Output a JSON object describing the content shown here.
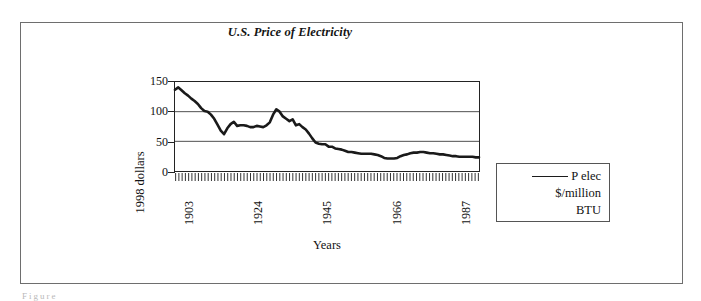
{
  "figure": {
    "caption_remnant": "Figure"
  },
  "legend": {
    "position": "right",
    "swatch": "line-swatch",
    "lines": [
      "P elec",
      "$/million",
      "BTU"
    ]
  },
  "chart_data": {
    "type": "line",
    "title": "U.S. Price of Electricity",
    "xlabel": "Years",
    "ylabel": "1998 dollars",
    "grid": true,
    "grid_axis": "y",
    "legend_position": "right",
    "xlim": [
      1902,
      1995
    ],
    "ylim": [
      0,
      150
    ],
    "y_ticks": [
      0,
      50,
      100,
      150
    ],
    "y_tick_labels": [
      "0",
      "50",
      "100",
      "150"
    ],
    "x_ticks": [
      1903,
      1924,
      1945,
      1966,
      1987
    ],
    "x_tick_labels": [
      "1903",
      "1924",
      "1945",
      "1966",
      "1987"
    ],
    "x_minor_tick_count": 94,
    "series": [
      {
        "name": "P elec $/million BTU",
        "color": "#1a1a1a",
        "x": [
          1902,
          1903,
          1904,
          1905,
          1906,
          1907,
          1908,
          1909,
          1910,
          1911,
          1912,
          1913,
          1914,
          1915,
          1916,
          1917,
          1918,
          1919,
          1920,
          1921,
          1922,
          1923,
          1924,
          1925,
          1926,
          1927,
          1928,
          1929,
          1930,
          1931,
          1932,
          1933,
          1934,
          1935,
          1936,
          1937,
          1938,
          1939,
          1940,
          1941,
          1942,
          1943,
          1944,
          1945,
          1946,
          1947,
          1948,
          1949,
          1950,
          1951,
          1952,
          1953,
          1954,
          1955,
          1956,
          1957,
          1958,
          1959,
          1960,
          1961,
          1962,
          1963,
          1964,
          1965,
          1966,
          1967,
          1968,
          1969,
          1970,
          1971,
          1972,
          1973,
          1974,
          1975,
          1976,
          1977,
          1978,
          1979,
          1980,
          1981,
          1982,
          1983,
          1984,
          1985,
          1986,
          1987,
          1988,
          1989,
          1990,
          1991,
          1992,
          1993,
          1994,
          1995
        ],
        "y": [
          137,
          141,
          136,
          131,
          127,
          122,
          118,
          113,
          106,
          101,
          100,
          95,
          88,
          78,
          68,
          62,
          72,
          79,
          83,
          76,
          77,
          77,
          76,
          74,
          74,
          76,
          75,
          74,
          77,
          82,
          95,
          104,
          100,
          92,
          88,
          84,
          87,
          77,
          79,
          74,
          70,
          63,
          55,
          48,
          46,
          45,
          45,
          41,
          41,
          38,
          37,
          36,
          34,
          32,
          32,
          31,
          30,
          29,
          29,
          29,
          29,
          28,
          27,
          25,
          22,
          21,
          21,
          21,
          22,
          25,
          27,
          28,
          30,
          31,
          31,
          32,
          32,
          31,
          30,
          30,
          29,
          28,
          28,
          27,
          26,
          25,
          25,
          24,
          24,
          24,
          24,
          24,
          23,
          23
        ]
      }
    ]
  }
}
